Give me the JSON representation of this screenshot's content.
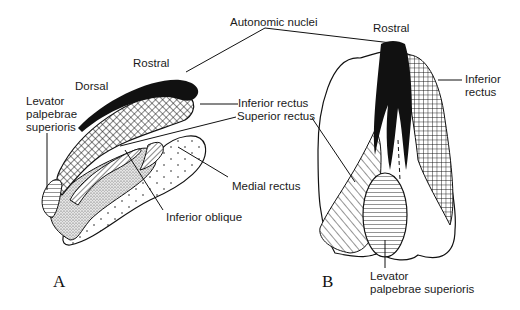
{
  "diagram": {
    "top_label": "Autonomic nuclei",
    "panel_a": {
      "letter": "A",
      "labels": {
        "rostral": "Rostral",
        "dorsal": "Dorsal",
        "levator": "Levator\npalpebrae\nsuperioris",
        "inferior_rectus": "Inferior rectus",
        "superior_rectus": "Superior rectus",
        "medial_rectus": "Medial rectus",
        "inferior_oblique": "Inferior oblique"
      }
    },
    "panel_b": {
      "letter": "B",
      "labels": {
        "rostral": "Rostral",
        "inferior_rectus": "Inferior\nrectus",
        "levator": "Levator\npalpebrae superioris"
      }
    },
    "legend_patterns": {
      "autonomic_nuclei": "solid-black",
      "inferior_rectus": "crosshatch",
      "superior_rectus": "diagonal-hatch",
      "medial_rectus": "sparse-dots",
      "inferior_oblique": "dense-stipple",
      "levator_palpebrae_superioris": "horizontal-lines"
    },
    "colors": {
      "ink": "#111111",
      "paper": "#ffffff"
    }
  }
}
